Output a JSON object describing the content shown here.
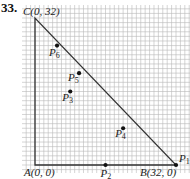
{
  "problem_number": "33.",
  "colors": {
    "grid": "#b9b9b9",
    "axis": "#333333",
    "points": "#111111"
  },
  "triangle": {
    "vertices": [
      {
        "name": "A",
        "label": "A(0, 0)",
        "x": 0,
        "y": 0
      },
      {
        "name": "B",
        "label": "B(32, 0)",
        "x": 32,
        "y": 0
      },
      {
        "name": "C",
        "label": "C(0, 32)",
        "x": 0,
        "y": 32
      }
    ]
  },
  "points": [
    {
      "name": "P1",
      "sub": "1",
      "x": 32,
      "y": 0
    },
    {
      "name": "P2",
      "sub": "2",
      "x": 16,
      "y": 0
    },
    {
      "name": "P3",
      "sub": "3",
      "x": 8,
      "y": 16
    },
    {
      "name": "P4",
      "sub": "4",
      "x": 20,
      "y": 8
    },
    {
      "name": "P5",
      "sub": "5",
      "x": 10,
      "y": 20
    },
    {
      "name": "P6",
      "sub": "6",
      "x": 5,
      "y": 26
    }
  ]
}
